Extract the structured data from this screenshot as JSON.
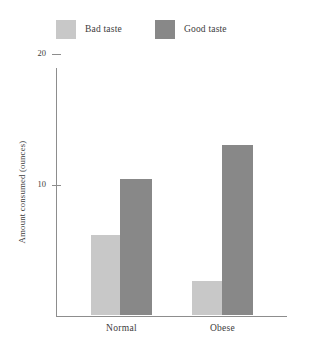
{
  "chart_data": {
    "type": "bar",
    "title": "",
    "xlabel": "",
    "ylabel": "Amount consumed (ounces)",
    "categories": [
      "Normal",
      "Obese"
    ],
    "series": [
      {
        "name": "Bad taste",
        "color": "#c8c8c8",
        "values": [
          6.1,
          2.6
        ]
      },
      {
        "name": "Good taste",
        "color": "#888888",
        "values": [
          10.4,
          13.0
        ]
      }
    ],
    "ylim": [
      0,
      20
    ],
    "yticks": [
      10,
      20
    ],
    "ytick_labels": [
      "10",
      "20"
    ],
    "grid": false,
    "legend_position": "top-left"
  },
  "legend": {
    "entries": [
      {
        "label": "Bad taste"
      },
      {
        "label": "Good taste"
      }
    ]
  },
  "axes": {
    "y_title": "Amount consumed (ounces)",
    "tick_20": "20",
    "tick_10": "10"
  },
  "categories": {
    "normal": "Normal",
    "obese": "Obese"
  },
  "colors": {
    "bad_taste": "#c8c8c8",
    "good_taste": "#888888",
    "axis": "#8d8d8d",
    "text": "#3c3c3c"
  }
}
